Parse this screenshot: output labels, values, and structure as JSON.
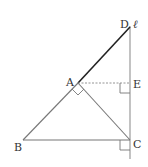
{
  "diagram": {
    "labels": {
      "D": "D",
      "ell": "ℓ",
      "A": "A",
      "E": "E",
      "B": "B",
      "C": "C"
    },
    "points": {
      "A": [
        78,
        83
      ],
      "B": [
        23,
        140
      ],
      "C": [
        130,
        140
      ],
      "D": [
        130,
        27
      ],
      "E": [
        130,
        83
      ]
    },
    "segments": [
      {
        "from": "A",
        "to": "D",
        "style": "solid-bold"
      },
      {
        "from": "A",
        "to": "B",
        "style": "solid"
      },
      {
        "from": "A",
        "to": "C",
        "style": "solid"
      },
      {
        "from": "B",
        "to": "C",
        "style": "solid"
      },
      {
        "from": "A",
        "to": "E",
        "style": "dashed"
      },
      {
        "line": "ℓ",
        "through": [
          "D",
          "E",
          "C"
        ],
        "style": "solid"
      }
    ],
    "right_angles": [
      "A (BAC)",
      "E (AEC)",
      "C (BCℓ)"
    ],
    "colors": {
      "line": "#888888",
      "bold_line": "#222222",
      "text": "#333333"
    }
  }
}
